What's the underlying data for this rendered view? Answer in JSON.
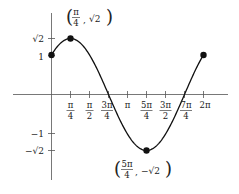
{
  "chart_data": {
    "type": "line",
    "title": "",
    "xlabel": "",
    "ylabel": "",
    "function": "y = sin(x) + cos(x)",
    "xlim": [
      0,
      6.2832
    ],
    "ylim": [
      -1.5,
      1.5
    ],
    "grid": false,
    "x_tick_labels": [
      "π/4",
      "π/2",
      "3π/4",
      "π",
      "5π/4",
      "3π/2",
      "7π/4",
      "2π"
    ],
    "x_tick_values": [
      0.7854,
      1.5708,
      2.3562,
      3.1416,
      3.927,
      4.7124,
      5.4978,
      6.2832
    ],
    "y_tick_labels": [
      "√2",
      "1",
      "−1",
      "−√2"
    ],
    "y_tick_values": [
      1.4142,
      1,
      -1,
      -1.4142
    ],
    "x": [
      0,
      0.7854,
      1.5708,
      2.3562,
      3.1416,
      3.927,
      4.7124,
      5.4978,
      6.2832
    ],
    "y": [
      1,
      1.4142,
      1,
      0,
      -1,
      -1.4142,
      -1,
      0,
      1
    ],
    "points": [
      {
        "x": 0,
        "y": 1,
        "label": ""
      },
      {
        "x": 0.7854,
        "y": 1.4142,
        "label": "(π/4, √2)"
      },
      {
        "x": 3.927,
        "y": -1.4142,
        "label": "(5π/4, −√2)"
      },
      {
        "x": 6.2832,
        "y": 1,
        "label": ""
      }
    ]
  },
  "labels": {
    "max_point": {
      "open": "(",
      "num": "π",
      "den": "4",
      "sep": ",",
      "val": "√2",
      "close": ")"
    },
    "min_point": {
      "open": "(",
      "num": "5π",
      "den": "4",
      "sep": ",",
      "val": "−√2",
      "close": ")"
    },
    "xticks": [
      {
        "num": "π",
        "den": "4"
      },
      {
        "num": "π",
        "den": "2"
      },
      {
        "num": "3π",
        "den": "4"
      },
      {
        "single": "π"
      },
      {
        "num": "5π",
        "den": "4"
      },
      {
        "num": "3π",
        "den": "2"
      },
      {
        "num": "7π",
        "den": "4"
      },
      {
        "single": "2π"
      }
    ],
    "yticks": [
      "√2",
      "1",
      "−1",
      "−√2"
    ]
  }
}
